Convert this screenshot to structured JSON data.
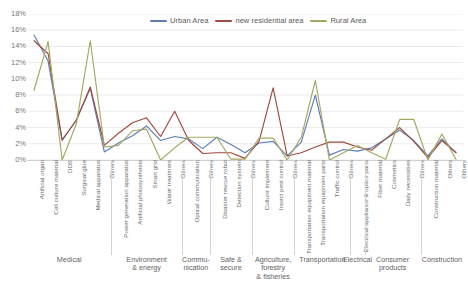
{
  "chart_data": {
    "type": "line",
    "title": "",
    "xlabel": "",
    "ylabel": "",
    "ylim": [
      0,
      18
    ],
    "ytick_labels": [
      "0%",
      "2%",
      "4%",
      "6%",
      "8%",
      "10%",
      "12%",
      "14%",
      "16%",
      "18%"
    ],
    "ytick_values": [
      0,
      2,
      4,
      6,
      8,
      10,
      12,
      14,
      16,
      18
    ],
    "grid": true,
    "legend_position": "top-center",
    "categories": [
      "Artificial organ",
      "Cell culture material",
      "DDS",
      "Surgical glue",
      "Medical apparatus",
      "Others",
      "Power generation apparatus",
      "Artificial photosynthesis",
      "Smart grid",
      "Water treatment",
      "Others",
      "Optical communication",
      "Others",
      "Disaster rescue robot",
      "Detection system",
      "Others",
      "Culture implement",
      "Insect pest control",
      "Others",
      "Transportation equipment material",
      "Transportation equipment parts",
      "Traffic control",
      "Others",
      "Electrical appliance & optics parts",
      "Fiber material",
      "Cosmetics",
      "Daily necessities",
      "Others",
      "Construction material",
      "Others",
      "Others"
    ],
    "groups": [
      {
        "label": "Medical",
        "count": 6
      },
      {
        "label": "Environment\n& energy",
        "count": 5
      },
      {
        "label": "Commu-\nnication",
        "count": 2
      },
      {
        "label": "Safe &\nsecure",
        "count": 3
      },
      {
        "label": "Agriculture,\nforestry\n& fisheries",
        "count": 3
      },
      {
        "label": "Transportation",
        "count": 4
      },
      {
        "label": "Electrical",
        "count": 1
      },
      {
        "label": "Consumer\nproducts",
        "count": 4
      },
      {
        "label": "Construction",
        "count": 3
      }
    ],
    "series": [
      {
        "name": "Urban Area",
        "color": "#5B7FB5",
        "values": [
          15.4,
          12.2,
          2.4,
          4.9,
          8.8,
          1.0,
          2.1,
          3.0,
          4.2,
          2.4,
          2.9,
          2.6,
          1.4,
          2.8,
          1.9,
          0.9,
          2.1,
          2.3,
          0.5,
          2.2,
          8.0,
          0.6,
          1.3,
          1.1,
          1.5,
          2.6,
          3.7,
          2.4,
          0.5,
          2.6,
          0.9
        ]
      },
      {
        "name": "new residential area",
        "color": "#A0493C",
        "values": [
          14.7,
          13.1,
          2.5,
          4.9,
          9.0,
          1.8,
          3.3,
          4.6,
          5.2,
          2.9,
          6.0,
          2.4,
          0.8,
          0.9,
          0.9,
          0.2,
          2.3,
          8.9,
          0.5,
          0.9,
          1.6,
          2.2,
          2.2,
          1.6,
          1.2,
          2.6,
          4.0,
          2.3,
          0.3,
          2.4,
          0.9
        ]
      },
      {
        "name": "Rural Area",
        "color": "#A5A662",
        "values": [
          8.6,
          14.6,
          0.0,
          4.4,
          14.7,
          1.6,
          1.8,
          3.6,
          3.8,
          0.0,
          1.5,
          2.8,
          2.8,
          2.8,
          0.1,
          0.1,
          2.7,
          2.7,
          0.0,
          2.8,
          9.8,
          0.0,
          0.9,
          1.8,
          0.9,
          0.1,
          5.0,
          5.0,
          0.0,
          3.2,
          0.1
        ]
      }
    ]
  },
  "legend": {
    "items": [
      {
        "label": "Urban Area",
        "color": "#5B7FB5"
      },
      {
        "label": "new residential area",
        "color": "#A0493C"
      },
      {
        "label": "Rural Area",
        "color": "#A5A662"
      }
    ]
  }
}
